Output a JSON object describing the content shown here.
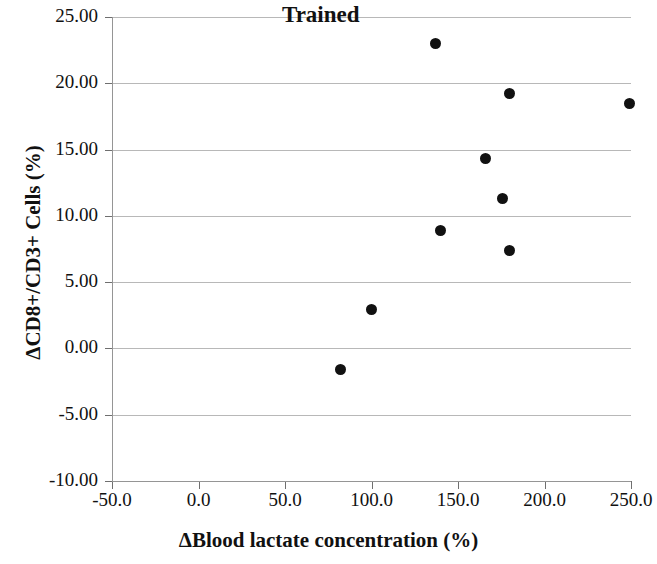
{
  "chart_data": {
    "type": "scatter",
    "title": "Trained",
    "xlabel": "ΔBlood lactate concentration (%)",
    "ylabel": "ΔCD8+/CD3+ Cells (%)",
    "xlim": [
      -50.0,
      250.0
    ],
    "ylim": [
      -10.0,
      25.0
    ],
    "xticks": [
      "-50.0",
      "0.0",
      "50.0",
      "100.0",
      "150.0",
      "200.0",
      "250.0"
    ],
    "xtick_values": [
      -50.0,
      0.0,
      50.0,
      100.0,
      150.0,
      200.0,
      250.0
    ],
    "yticks": [
      "-10.00",
      "-5.00",
      "0.00",
      "5.00",
      "10.00",
      "15.00",
      "20.00",
      "25.00"
    ],
    "ytick_values": [
      -10.0,
      -5.0,
      0.0,
      5.0,
      10.0,
      15.0,
      20.0,
      25.0
    ],
    "grid": "horizontal",
    "legend": "none",
    "marker": "filled-circle",
    "marker_color": "#111111",
    "series": [
      {
        "name": "Trained",
        "points": [
          {
            "x": 82.0,
            "y": -1.6
          },
          {
            "x": 100.0,
            "y": 2.9
          },
          {
            "x": 137.0,
            "y": 23.0
          },
          {
            "x": 140.0,
            "y": 8.9
          },
          {
            "x": 166.0,
            "y": 14.3
          },
          {
            "x": 176.0,
            "y": 11.3
          },
          {
            "x": 180.0,
            "y": 19.2
          },
          {
            "x": 180.0,
            "y": 7.4
          },
          {
            "x": 249.0,
            "y": 18.5
          }
        ]
      }
    ]
  },
  "axes": {
    "grid_color": "#b8b8b8",
    "axis_color": "#959595"
  }
}
